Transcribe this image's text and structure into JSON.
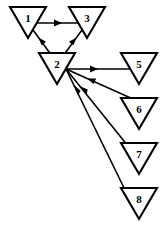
{
  "diagram": {
    "canvas": {
      "width": 163,
      "height": 231,
      "background": "#ffffff"
    },
    "style": {
      "node_fill": "#ffffff",
      "node_stroke": "#000000",
      "edge_color": "#000000",
      "label_color": "#000000"
    },
    "nodes": [
      {
        "id": "n1",
        "label": "1",
        "shape": "down-triangle",
        "cx": 28,
        "cy": 22,
        "w": 36,
        "h": 31
      },
      {
        "id": "n3",
        "label": "3",
        "shape": "down-triangle",
        "cx": 87,
        "cy": 22,
        "w": 36,
        "h": 31
      },
      {
        "id": "n2",
        "label": "2",
        "shape": "down-triangle",
        "cx": 57,
        "cy": 68,
        "w": 36,
        "h": 31
      },
      {
        "id": "n5",
        "label": "5",
        "shape": "down-triangle",
        "cx": 139,
        "cy": 68,
        "w": 36,
        "h": 31
      },
      {
        "id": "n6",
        "label": "6",
        "shape": "down-triangle",
        "cx": 139,
        "cy": 113,
        "w": 36,
        "h": 31
      },
      {
        "id": "n7",
        "label": "7",
        "shape": "down-triangle",
        "cx": 139,
        "cy": 158,
        "w": 36,
        "h": 31
      },
      {
        "id": "n8",
        "label": "8",
        "shape": "down-triangle",
        "cx": 139,
        "cy": 203,
        "w": 36,
        "h": 31
      }
    ],
    "edges": [
      {
        "id": "e1",
        "from": "1",
        "to": "3",
        "direction": "1->3",
        "arrow_at": "middle",
        "kind": "horizontal"
      },
      {
        "id": "e2",
        "from": "2",
        "to": "1",
        "direction": "2->1",
        "arrow_at": "middle",
        "kind": "diagonal-up-left"
      },
      {
        "id": "e3",
        "from": "2",
        "to": "3",
        "direction": "2->3",
        "arrow_at": "middle",
        "kind": "diagonal-up-right"
      },
      {
        "id": "e4",
        "from": "2",
        "to": "5",
        "direction": "2->5",
        "arrow_at": "middle",
        "kind": "horizontal"
      },
      {
        "id": "e5",
        "from": "6",
        "to": "2",
        "direction": "6->2",
        "arrow_at": "middle",
        "kind": "diagonal-down-right"
      },
      {
        "id": "e6",
        "from": "7",
        "to": "2",
        "direction": "7->2",
        "arrow_at": "middle",
        "kind": "diagonal-down-right"
      },
      {
        "id": "e7",
        "from": "8",
        "to": "2",
        "direction": "8->2",
        "arrow_at": "middle",
        "kind": "diagonal-down-right"
      }
    ]
  }
}
